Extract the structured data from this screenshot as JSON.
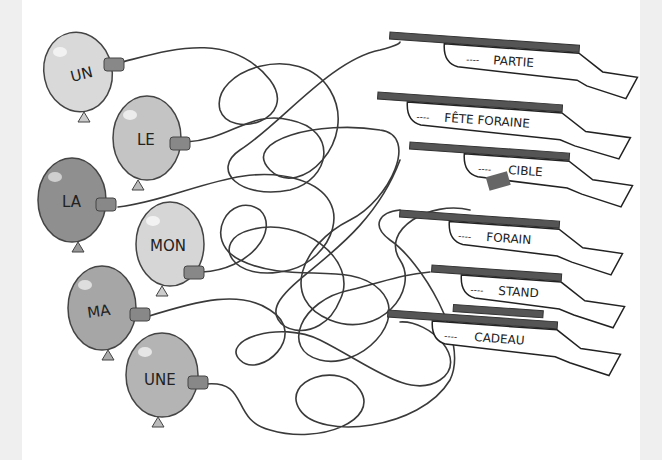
{
  "puzzle": {
    "type": "string maze - match article to noun",
    "balloons": [
      {
        "label": "UN",
        "fill": "#d9d9d9",
        "cx": 78,
        "cy": 72,
        "rx": 34,
        "ry": 40,
        "rot": -12
      },
      {
        "label": "LE",
        "fill": "#c4c4c4",
        "cx": 147,
        "cy": 138,
        "rx": 34,
        "ry": 42,
        "rot": 0
      },
      {
        "label": "LA",
        "fill": "#8f8f8f",
        "cx": 72,
        "cy": 200,
        "rx": 34,
        "ry": 42,
        "rot": 0
      },
      {
        "label": "MON",
        "fill": "#d6d6d6",
        "cx": 170,
        "cy": 244,
        "rx": 34,
        "ry": 42,
        "rot": 0
      },
      {
        "label": "MA",
        "fill": "#a6a6a6",
        "cx": 102,
        "cy": 308,
        "rx": 34,
        "ry": 42,
        "rot": 0
      },
      {
        "label": "UNE",
        "fill": "#b4b4b4",
        "cx": 162,
        "cy": 375,
        "rx": 36,
        "ry": 42,
        "rot": 0
      }
    ],
    "rifles": [
      {
        "label": "PARTIE",
        "y": 40
      },
      {
        "label": "FÊTE FORAINE",
        "y": 98
      },
      {
        "label": "CIBLE",
        "y": 148
      },
      {
        "label": "FORAIN",
        "y": 215
      },
      {
        "label": "STAND",
        "y": 270
      },
      {
        "label": "CADEAU",
        "y": 315
      }
    ],
    "blank": "----"
  },
  "colors": {
    "line": "#3a3a3a",
    "barrel": "#555555",
    "edge": "#efefef"
  }
}
